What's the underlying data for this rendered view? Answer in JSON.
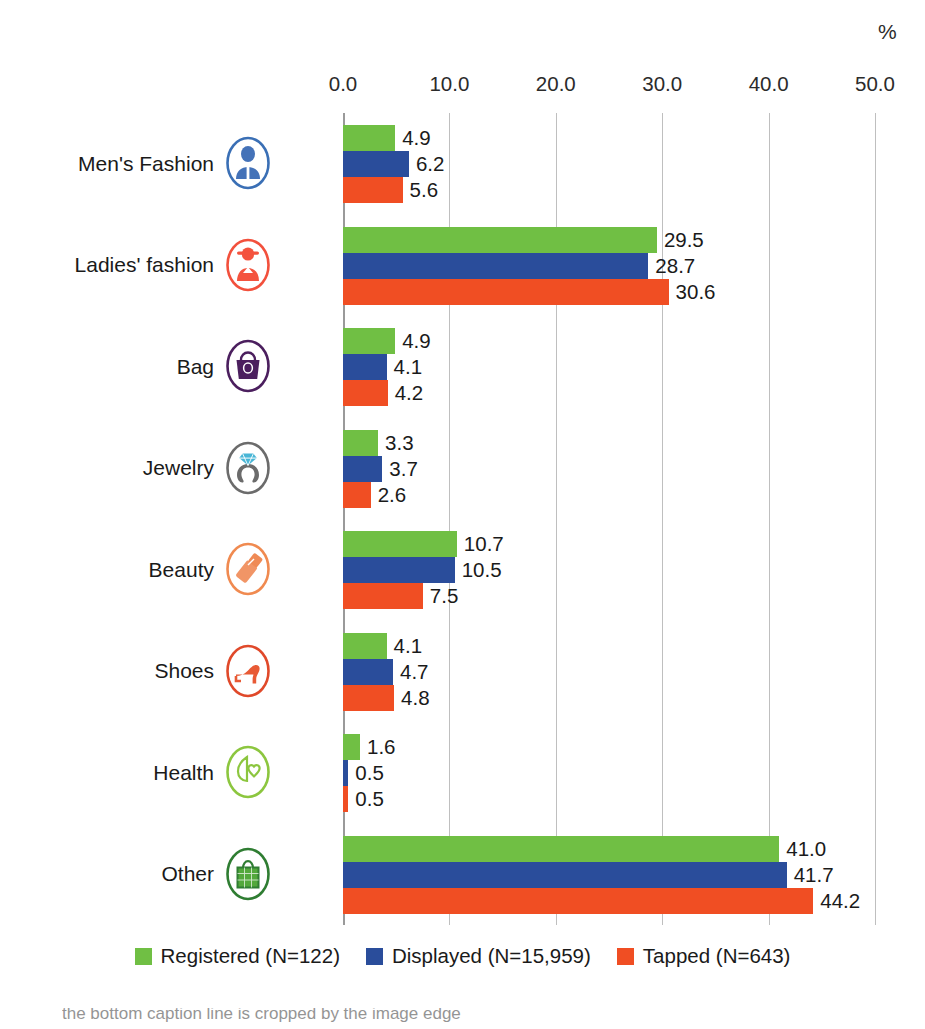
{
  "unit_label": "%",
  "colors": {
    "registered": "#70bf44",
    "displayed": "#2a4d9b",
    "tapped": "#f04e23",
    "gridline": "#bfbfbf",
    "text": "#1a1a1a"
  },
  "legend": {
    "items": [
      {
        "label": "Registered (N=122)",
        "key": "registered"
      },
      {
        "label": "Displayed (N=15,959)",
        "key": "displayed"
      },
      {
        "label": "Tapped (N=643)",
        "key": "tapped"
      }
    ]
  },
  "caption": {
    "text": "the bottom caption line is cropped by the image edge"
  },
  "icons": [
    {
      "name": "mens-fashion-icon",
      "ring": "#3a6fb5",
      "fill": "#4472b8"
    },
    {
      "name": "ladies-fashion-icon",
      "ring": "#f2503c",
      "fill": "#f4533e"
    },
    {
      "name": "bag-icon",
      "ring": "#4b1f5e",
      "fill": "#4b1f5e"
    },
    {
      "name": "jewelry-icon",
      "ring": "#6b6b6b",
      "fill": "#49b6d6"
    },
    {
      "name": "beauty-icon",
      "ring": "#f08a50",
      "fill": "#ef8a55"
    },
    {
      "name": "shoes-icon",
      "ring": "#e0492a",
      "fill": "#e85a35"
    },
    {
      "name": "health-icon",
      "ring": "#8cc63f",
      "fill": "#8cc63f"
    },
    {
      "name": "other-icon",
      "ring": "#2f7d32",
      "fill": "#53a83c"
    }
  ],
  "chart_data": {
    "type": "bar",
    "title": "",
    "subtitle": "",
    "xlabel": "%",
    "ylabel": "",
    "orientation": "horizontal",
    "xlim": [
      0,
      50
    ],
    "xticks": [
      "0.0",
      "10.0",
      "20.0",
      "30.0",
      "40.0",
      "50.0"
    ],
    "xtick_values": [
      0,
      10,
      20,
      30,
      40,
      50
    ],
    "grid": true,
    "legend_position": "bottom",
    "categories": [
      "Men's Fashion",
      "Ladies' fashion",
      "Bag",
      "Jewelry",
      "Beauty",
      "Shoes",
      "Health",
      "Other"
    ],
    "series": [
      {
        "name": "Registered (N=122)",
        "color": "#70bf44",
        "values": [
          4.9,
          29.5,
          4.9,
          3.3,
          10.7,
          4.1,
          1.6,
          41.0
        ],
        "labels": [
          "4.9",
          "29.5",
          "4.9",
          "3.3",
          "10.7",
          "4.1",
          "1.6",
          "41.0"
        ]
      },
      {
        "name": "Displayed (N=15,959)",
        "color": "#2a4d9b",
        "values": [
          6.2,
          28.7,
          4.1,
          3.7,
          10.5,
          4.7,
          0.5,
          41.7
        ],
        "labels": [
          "6.2",
          "28.7",
          "4.1",
          "3.7",
          "10.5",
          "4.7",
          "0.5",
          "41.7"
        ]
      },
      {
        "name": "Tapped (N=643)",
        "color": "#f04e23",
        "values": [
          5.6,
          30.6,
          4.2,
          2.6,
          7.5,
          4.8,
          0.5,
          44.2
        ],
        "labels": [
          "5.6",
          "30.6",
          "4.2",
          "2.6",
          "7.5",
          "4.8",
          "0.5",
          "44.2"
        ]
      }
    ]
  }
}
